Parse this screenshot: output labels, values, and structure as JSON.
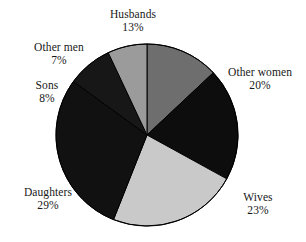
{
  "chart_data": {
    "type": "pie",
    "title": "",
    "subtitle": "",
    "xlabel": "",
    "ylabel": "",
    "grid": false,
    "legend_position": "none",
    "label_format": "name + percent, outside slices",
    "start_angle_deg": 0,
    "direction": "clockwise",
    "categories": [
      "Husbands",
      "Other women",
      "Wives",
      "Daughters",
      "Sons",
      "Other men"
    ],
    "values": [
      13,
      20,
      23,
      29,
      8,
      7
    ],
    "units": "percent",
    "total": 100,
    "slices": [
      {
        "label": "Husbands",
        "percent": "13%",
        "value": 13,
        "color": "#6e6e6e",
        "start_deg": 0,
        "end_deg": 46.8
      },
      {
        "label": "Other women",
        "percent": "20%",
        "value": 20,
        "color": "#0d0d0d",
        "start_deg": 46.8,
        "end_deg": 118.8
      },
      {
        "label": "Wives",
        "percent": "23%",
        "value": 23,
        "color": "#c9c9c9",
        "start_deg": 118.8,
        "end_deg": 201.6
      },
      {
        "label": "Daughters",
        "percent": "29%",
        "value": 29,
        "color": "#111111",
        "start_deg": 201.6,
        "end_deg": 306.0
      },
      {
        "label": "Sons",
        "percent": "8%",
        "value": 8,
        "color": "#171717",
        "start_deg": 306.0,
        "end_deg": 334.8
      },
      {
        "label": "Other men",
        "percent": "7%",
        "value": 7,
        "color": "#9b9b9b",
        "start_deg": 334.8,
        "end_deg": 360.0
      }
    ],
    "stroke_color": "#000000",
    "background_color": "#ffffff"
  },
  "labels": {
    "husbands": {
      "name": "Husbands",
      "pct": "13%"
    },
    "other_men": {
      "name": "Other men",
      "pct": "7%"
    },
    "sons": {
      "name": "Sons",
      "pct": "8%"
    },
    "daughters": {
      "name": "Daughters",
      "pct": "29%"
    },
    "wives": {
      "name": "Wives",
      "pct": "23%"
    },
    "other_women": {
      "name": "Other women",
      "pct": "20%"
    }
  }
}
